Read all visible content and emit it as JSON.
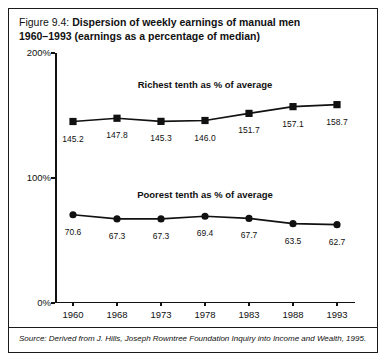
{
  "caption": {
    "lead": "Figure 9.4: ",
    "bold_line1": "Dispersion of weekly earnings of manual men",
    "bold_line2": "1960–1993 (earnings as a percentage of median)"
  },
  "source": {
    "text": "Source: Derived from J. Hills, Joseph Rowntree Foundation Inquiry into Income and Wealth, 1995."
  },
  "chart_data": {
    "type": "line",
    "title": "Dispersion of weekly earnings of manual men 1960–1993 (earnings as a percentage of median)",
    "xlabel": "",
    "ylabel": "",
    "categories": [
      "1960",
      "1968",
      "1973",
      "1978",
      "1983",
      "1988",
      "1993"
    ],
    "ylim": [
      0,
      200
    ],
    "yticks": [
      0,
      100,
      200
    ],
    "ytick_labels": [
      "0%",
      "100%",
      "200%"
    ],
    "grid": false,
    "legend_position": "inline-above-series",
    "series": [
      {
        "name": "Richest tenth as % of average",
        "marker": "square",
        "values": [
          145.2,
          147.8,
          145.3,
          146.0,
          151.7,
          157.1,
          158.7
        ],
        "value_labels": [
          "145.2",
          "147.8",
          "145.3",
          "146.0",
          "151.7",
          "157.1",
          "158.7"
        ]
      },
      {
        "name": "Poorest tenth as % of average",
        "marker": "circle",
        "values": [
          70.6,
          67.3,
          67.3,
          69.4,
          67.7,
          63.5,
          62.7
        ],
        "value_labels": [
          "70.6",
          "67.3",
          "67.3",
          "69.4",
          "67.7",
          "63.5",
          "62.7"
        ]
      }
    ]
  }
}
